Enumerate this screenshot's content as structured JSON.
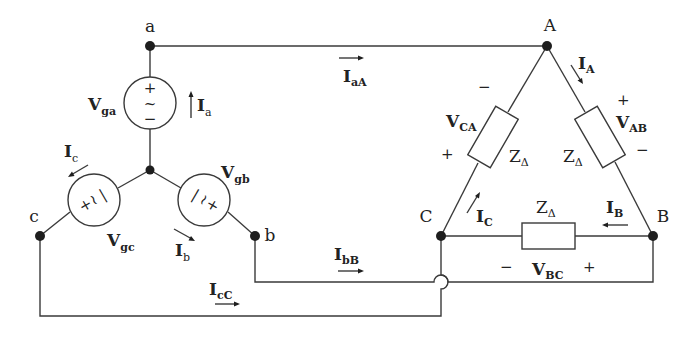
{
  "diagram": {
    "type": "three-phase Y-source to Delta-load circuit",
    "source_nodes": {
      "a": "a",
      "b": "b",
      "c": "c"
    },
    "load_nodes": {
      "A": "A",
      "B": "B",
      "C": "C"
    },
    "sources": [
      {
        "name": "V",
        "sub": "ga",
        "symbol": "~",
        "plus": "+",
        "minus": "−"
      },
      {
        "name": "V",
        "sub": "gb"
      },
      {
        "name": "V",
        "sub": "gc"
      }
    ],
    "phase_currents": [
      {
        "name": "I",
        "sub": "a"
      },
      {
        "name": "I",
        "sub": "b"
      },
      {
        "name": "I",
        "sub": "c"
      }
    ],
    "line_currents": [
      {
        "name": "I",
        "sub": "aA"
      },
      {
        "name": "I",
        "sub": "bB"
      },
      {
        "name": "I",
        "sub": "cC"
      }
    ],
    "delta_currents": [
      {
        "name": "I",
        "sub": "A"
      },
      {
        "name": "I",
        "sub": "B"
      },
      {
        "name": "I",
        "sub": "C"
      }
    ],
    "delta_voltages": [
      {
        "name": "V",
        "sub": "AB",
        "plus": "+",
        "minus": "−"
      },
      {
        "name": "V",
        "sub": "BC",
        "plus": "+",
        "minus": "−"
      },
      {
        "name": "V",
        "sub": "CA",
        "plus": "+",
        "minus": "−"
      }
    ],
    "impedance": {
      "name": "Z",
      "sub": "Δ"
    }
  }
}
